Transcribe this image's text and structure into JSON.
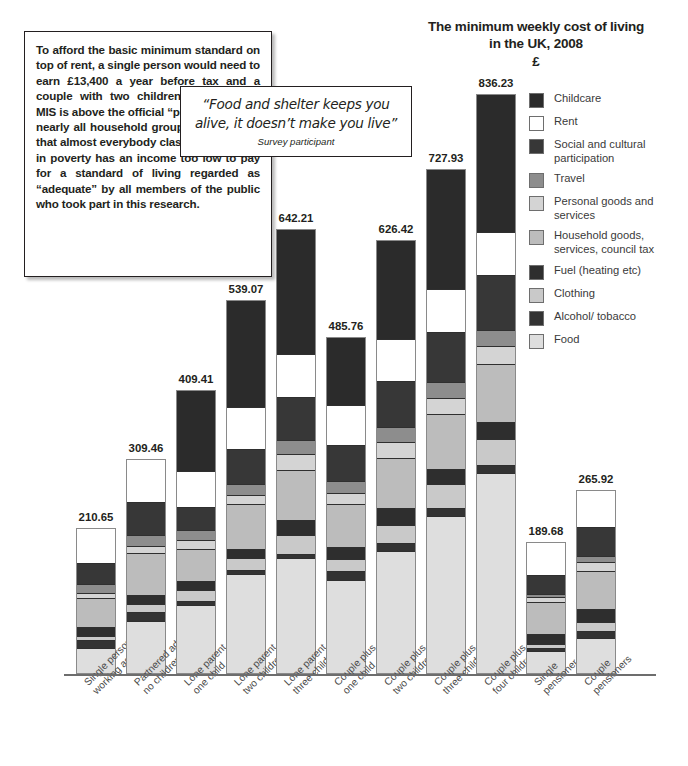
{
  "title": {
    "line1": "The minimum weekly cost of living",
    "line2": "in the UK, 2008",
    "currency": "£"
  },
  "textbox": {
    "body": "To afford the basic minimum standard on top of rent, a single person would need to earn £13,400 a year before tax and a couple with two children £26,800. The MIS is above the official “poverty line” for nearly all household groups. This shows that almost everybody classified as being in poverty has an income too low to pay for a standard of living regarded as “adequate” by all members of the public who took part in this research."
  },
  "quote": {
    "text": "“Food and shelter keeps you alive, it doesn’t make you live”",
    "attribution": "Survey participant"
  },
  "legend": {
    "items": [
      {
        "label": "Childcare",
        "color": "#2b2b2b"
      },
      {
        "label": "Rent",
        "color": "#ffffff"
      },
      {
        "label": "Social and cultural participation",
        "color": "#373737"
      },
      {
        "label": "Travel",
        "color": "#8d8d8d"
      },
      {
        "label": "Personal goods and services",
        "color": "#d4d4d4"
      },
      {
        "label": "Household goods, services, council tax",
        "color": "#bcbcbc"
      },
      {
        "label": "Fuel (heating etc)",
        "color": "#2e2e2e"
      },
      {
        "label": "Clothing",
        "color": "#c9c9c9"
      },
      {
        "label": "Alcohol/ tobacco",
        "color": "#333333"
      },
      {
        "label": "Food",
        "color": "#dedede"
      }
    ]
  },
  "chart_data": {
    "type": "bar",
    "subtype": "stacked-vertical",
    "title": "The minimum weekly cost of living in the UK, 2008",
    "xlabel": "",
    "ylabel": "£",
    "grid": false,
    "legend_position": "right",
    "ylim": [
      0,
      880
    ],
    "categories": [
      "Single person working age",
      "Partnered adults no children",
      "Lone parent one child",
      "Lone parent two children",
      "Lone parent three children",
      "Couple plus one child",
      "Couple plus two children",
      "Couple plus three children",
      "Couple plus four children",
      "Single pensioner",
      "Couple pensioners"
    ],
    "totals": [
      210.65,
      309.46,
      409.41,
      539.07,
      642.21,
      485.76,
      626.42,
      727.93,
      836.23,
      189.68,
      265.92
    ],
    "total_labels": [
      "210.65",
      "309.46",
      "409.41",
      "539.07",
      "642.21",
      "485.76",
      "626.42",
      "727.93",
      "836.23",
      "189.68",
      "265.92"
    ],
    "series": [
      {
        "name": "Childcare",
        "color": "#2b2b2b",
        "values": [
          0,
          0,
          118.0,
          155.0,
          182.0,
          100.0,
          145.0,
          175.0,
          200.0,
          0,
          0
        ]
      },
      {
        "name": "Rent",
        "color": "#ffffff",
        "values": [
          52.0,
          63.0,
          52.0,
          61.0,
          62.0,
          57.0,
          60.0,
          62.0,
          63.0,
          48.0,
          56.0
        ]
      },
      {
        "name": "Social and cultural participation",
        "color": "#373737",
        "values": [
          30.0,
          48.0,
          33.0,
          50.0,
          62.0,
          52.0,
          67.0,
          72.0,
          78.0,
          28.0,
          41.0
        ]
      },
      {
        "name": "Travel",
        "color": "#8d8d8d",
        "values": [
          13.0,
          16.0,
          14.0,
          16.0,
          21.0,
          17.0,
          22.0,
          22.0,
          24.0,
          4.0,
          9.0
        ]
      },
      {
        "name": "Personal goods and services",
        "color": "#d4d4d4",
        "values": [
          8.0,
          10.0,
          14.0,
          14.0,
          22.0,
          16.0,
          23.0,
          24.0,
          26.0,
          8.0,
          13.0
        ]
      },
      {
        "name": "Household goods, services, council tax",
        "color": "#bcbcbc",
        "values": [
          42.0,
          60.0,
          46.0,
          64.0,
          72.0,
          62.0,
          72.0,
          79.0,
          84.0,
          46.0,
          55.0
        ]
      },
      {
        "name": "Fuel (heating etc)",
        "color": "#2e2e2e",
        "values": [
          13.0,
          13.0,
          13.0,
          14.0,
          22.0,
          17.0,
          24.0,
          22.0,
          24.0,
          14.0,
          19.0
        ]
      },
      {
        "name": "Clothing",
        "color": "#c9c9c9",
        "values": [
          5.0,
          12.0,
          16.0,
          16.0,
          28.0,
          18.0,
          26.0,
          34.0,
          37.0,
          6.0,
          13.0
        ]
      },
      {
        "name": "Alcohol/ tobacco",
        "color": "#333333",
        "values": [
          12.0,
          12.0,
          6.0,
          6.0,
          6.0,
          12.0,
          12.0,
          12.0,
          12.0,
          4.0,
          9.0
        ]
      },
      {
        "name": "Food",
        "color": "#dedede",
        "values": [
          35.65,
          75.46,
          97.41,
          143.07,
          165.21,
          134.76,
          175.42,
          225.93,
          288.23,
          31.68,
          50.92
        ]
      }
    ]
  }
}
